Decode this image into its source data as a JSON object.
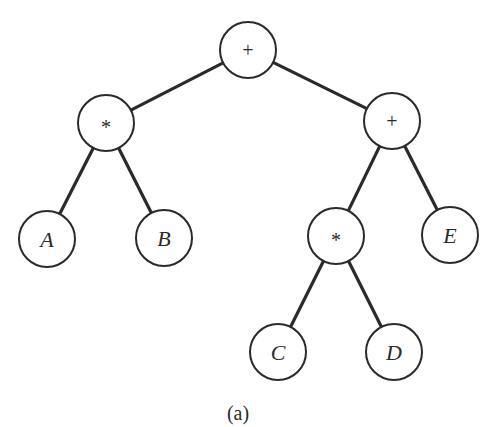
{
  "diagram": {
    "type": "expression-tree",
    "caption": "(a)",
    "nodes": [
      {
        "id": "n1",
        "label": "+",
        "kind": "operator",
        "x": 248,
        "y": 50
      },
      {
        "id": "n2",
        "label": "*",
        "kind": "operator",
        "x": 106,
        "y": 123
      },
      {
        "id": "n3",
        "label": "+",
        "kind": "operator",
        "x": 392,
        "y": 121
      },
      {
        "id": "n4",
        "label": "A",
        "kind": "operand",
        "x": 47,
        "y": 239
      },
      {
        "id": "n5",
        "label": "B",
        "kind": "operand",
        "x": 164,
        "y": 238
      },
      {
        "id": "n6",
        "label": "*",
        "kind": "operator",
        "x": 336,
        "y": 236
      },
      {
        "id": "n7",
        "label": "E",
        "kind": "operand",
        "x": 450,
        "y": 235
      },
      {
        "id": "n8",
        "label": "C",
        "kind": "operand",
        "x": 278,
        "y": 352
      },
      {
        "id": "n9",
        "label": "D",
        "kind": "operand",
        "x": 394,
        "y": 352
      }
    ],
    "edges": [
      {
        "from": "n1",
        "to": "n2"
      },
      {
        "from": "n1",
        "to": "n3"
      },
      {
        "from": "n2",
        "to": "n4"
      },
      {
        "from": "n2",
        "to": "n5"
      },
      {
        "from": "n3",
        "to": "n6"
      },
      {
        "from": "n3",
        "to": "n7"
      },
      {
        "from": "n6",
        "to": "n8"
      },
      {
        "from": "n6",
        "to": "n9"
      }
    ],
    "node_radius": 28,
    "colors": {
      "stroke": "#2a2a2a",
      "fill": "#ffffff",
      "background": "#ffffff"
    }
  }
}
